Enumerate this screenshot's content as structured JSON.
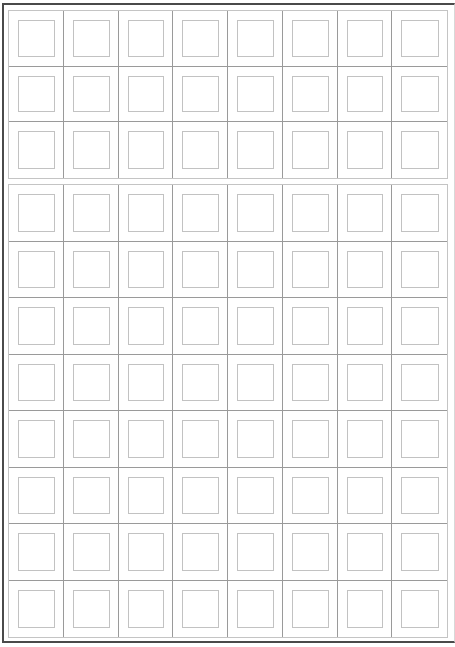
{
  "worksheet": {
    "type": "blank practice grid",
    "columns": 8,
    "blocks": [
      {
        "name": "top-block",
        "rows": 3
      },
      {
        "name": "bottom-block",
        "rows": 8
      }
    ],
    "colors": {
      "frame_border": "#4a4a4a",
      "cell_divider": "#9a9a9a",
      "block_outline": "#c4c4c4",
      "inner_square": "#c2c2c2",
      "background": "#ffffff"
    }
  }
}
